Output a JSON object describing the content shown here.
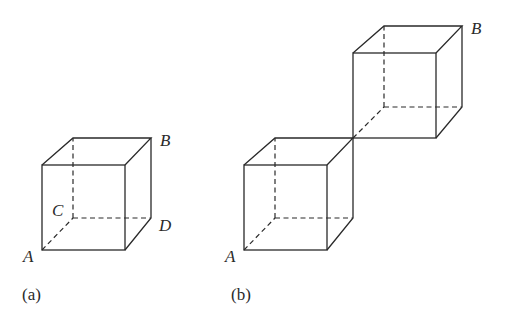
{
  "figure": {
    "panel_a": {
      "caption": "(a)",
      "labels": {
        "A": "A",
        "B": "B",
        "C": "C",
        "D": "D"
      }
    },
    "panel_b": {
      "caption": "(b)",
      "labels": {
        "A": "A",
        "B": "B"
      }
    }
  }
}
